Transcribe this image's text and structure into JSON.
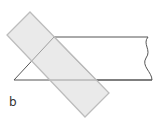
{
  "figure": {
    "label": "b",
    "colors": {
      "background": "#ffffff",
      "outline": "#555555",
      "rectangle_fill": "#ececec",
      "rectangle_stroke": "#c4c4c4"
    },
    "shapes": {
      "rectangle_points": "30,12 109,93 85,117 7,35",
      "triangle_points": "54,37 96,80 14,80",
      "top_line": {
        "x1": 54,
        "y1": 37,
        "x2": 148,
        "y2": 37
      },
      "bottom_line": {
        "x1": 96,
        "y1": 80,
        "x2": 152,
        "y2": 80
      },
      "wavy_edge_path": "M148,37 C142,44 152,50 146,58 C141,66 152,72 152,80"
    }
  }
}
